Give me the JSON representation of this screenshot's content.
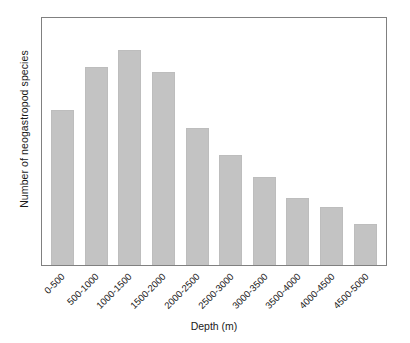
{
  "chart_data": {
    "type": "bar",
    "title": "",
    "xlabel": "Depth (m)",
    "ylabel": "Number of neogastropod species",
    "categories": [
      "0-500",
      "500-1000",
      "1000-1500",
      "1500-2000",
      "2000-2500",
      "2500-3000",
      "3000-3500",
      "3500-4000",
      "4000-4500",
      "4500-5000"
    ],
    "values": [
      72,
      92,
      100,
      90,
      64,
      51,
      41,
      31,
      27,
      19
    ],
    "ylim": [
      0,
      115
    ],
    "grid": false,
    "legend": null,
    "bar_color": "#c3c3c3",
    "bar_edge_color": "#bdbdbd",
    "frame_color": "#808080",
    "background_color": "#ffffff",
    "axis_ticks_shown": false,
    "y_tick_labels": [],
    "x_tick_rotation": "45"
  }
}
